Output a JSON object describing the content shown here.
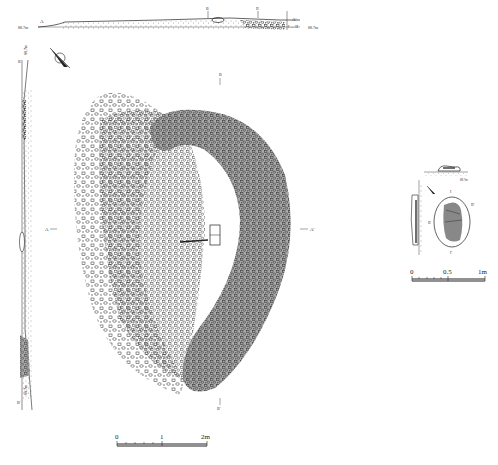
{
  "figure": {
    "type": "archaeological-site-plan",
    "background": "#ffffff",
    "ink_color": "#222222",
    "fill_gray": "#a8a8a8"
  },
  "top_section": {
    "left_label": "A",
    "right_label": "A'",
    "left_elevation": "88.7m",
    "right_elevation": "88.7m",
    "marker_1": "B",
    "marker_2": "II",
    "inset_label": "I — II"
  },
  "left_section": {
    "top_label": "B",
    "bottom_label": "B'",
    "top_elevation": "88.7m",
    "bottom_elevation": "88.7m"
  },
  "plan": {
    "west_label": "A",
    "east_label": "A'",
    "north_label": "B",
    "south_label": "B'"
  },
  "main_scale": {
    "ticks": [
      "0",
      "1",
      "2m"
    ]
  },
  "detail": {
    "top_label": "I",
    "bottom_label": "I'",
    "left_label": "II",
    "right_label": "II'",
    "small_caption": "88.7m",
    "scale_ticks": [
      "0",
      "0.5",
      "1m"
    ]
  }
}
